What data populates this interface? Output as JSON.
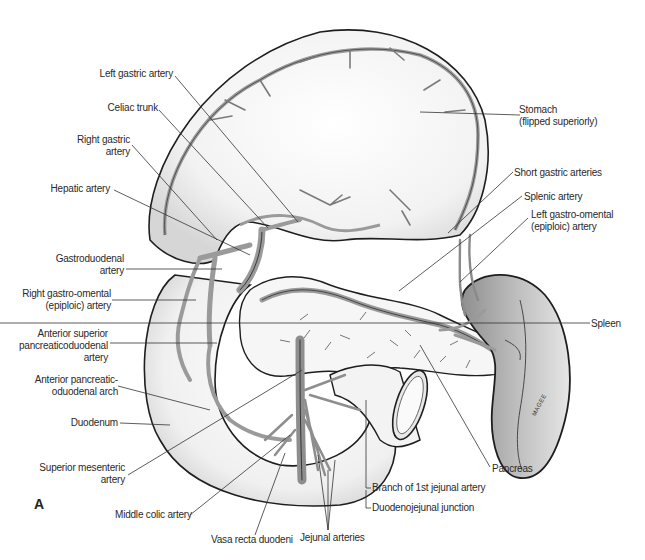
{
  "figure": {
    "panel_letter": "A",
    "artist_signature": "MAGEE",
    "colors": {
      "background": "#ffffff",
      "outline": "#1e1e1e",
      "artery_fill": "#9a9a9a",
      "organ_shade": "#d8d8d8",
      "spleen_fill": "#b8b8b8",
      "label_text": "#2a2a2a",
      "leader_line": "#333333"
    },
    "labels_left": [
      {
        "text": "Left gastric artery"
      },
      {
        "text": "Celiac trunk"
      },
      {
        "text": "Right gastric",
        "text2": "artery"
      },
      {
        "text": "Hepatic artery"
      },
      {
        "text": "Gastroduodenal",
        "text2": "artery"
      },
      {
        "text": "Right gastro-omental",
        "text2": "(epiploic) artery"
      },
      {
        "text": "Anterior superior",
        "text2": "pancreaticoduodenal",
        "text3": "artery"
      },
      {
        "text": "Anterior pancreatic-",
        "text2": "oduodenal arch"
      },
      {
        "text": "Duodenum"
      },
      {
        "text": "Superior mesenteric",
        "text2": "artery"
      }
    ],
    "labels_right": [
      {
        "text": "Stomach",
        "text2": "(flipped superiorly)"
      },
      {
        "text": "Short gastric arteries"
      },
      {
        "text": "Splenic artery"
      },
      {
        "text": "Left gastro-omental",
        "text2": "(epiploic) artery"
      },
      {
        "text": "Spleen"
      },
      {
        "text": "Pancreas"
      }
    ],
    "labels_bottom": [
      {
        "text": "Middle colic artery"
      },
      {
        "text": "Vasa recta duodeni"
      },
      {
        "text": "Jejunal arteries"
      },
      {
        "text": "Branch of 1st jejunal artery"
      },
      {
        "text": "Duodenojejunal junction"
      }
    ]
  }
}
